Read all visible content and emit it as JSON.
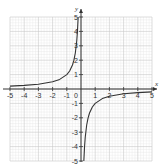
{
  "chart_data": {
    "type": "line",
    "title": "",
    "function": "y = -1/x",
    "xlabel": "x",
    "ylabel": "y",
    "xlim": [
      -5,
      5
    ],
    "ylim": [
      -5,
      5
    ],
    "grid": true,
    "minor_grid_per_unit": 5,
    "x_ticks": [
      -5,
      -4,
      -3,
      -2,
      -1,
      1,
      2,
      3,
      4,
      5
    ],
    "y_ticks": [
      -5,
      -4,
      -3,
      -2,
      -1,
      1,
      2,
      3,
      4,
      5
    ],
    "origin_label": "0",
    "series": [
      {
        "name": "left branch",
        "x": [
          -5,
          -4,
          -3,
          -2,
          -1.5,
          -1,
          -0.8,
          -0.6,
          -0.5,
          -0.4,
          -0.3,
          -0.25,
          -0.2
        ],
        "y": [
          0.2,
          0.25,
          0.333,
          0.5,
          0.667,
          1,
          1.25,
          1.667,
          2,
          2.5,
          3.333,
          4,
          5
        ]
      },
      {
        "name": "right branch",
        "x": [
          0.2,
          0.25,
          0.3,
          0.4,
          0.5,
          0.6,
          0.8,
          1,
          1.5,
          2,
          3,
          4,
          5
        ],
        "y": [
          -5,
          -4,
          -3.333,
          -2.5,
          -2,
          -1.667,
          -1.25,
          -1,
          -0.667,
          -0.5,
          -0.333,
          -0.25,
          -0.2
        ]
      }
    ],
    "colors": {
      "curve": "#333333",
      "axis": "#333333",
      "grid_major": "#c8c8c8",
      "grid_minor": "#e6e6e6"
    }
  }
}
